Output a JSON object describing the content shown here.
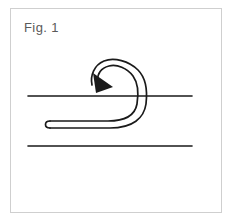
{
  "figure": {
    "caption": "Fig. 1",
    "caption_color": "#5a5a5a",
    "frame_color": "#cfcfcf",
    "background_color": "#ffffff",
    "ink_color": "#1a1a1a",
    "frame": {
      "x": 10,
      "y": 8,
      "width": 212,
      "height": 205
    },
    "caption_position": {
      "x": 24,
      "y": 20
    },
    "elements": {
      "upper_strand": {
        "name": "upper-horizontal-line",
        "x1": 28,
        "y1": 96,
        "x2": 192,
        "y2": 96,
        "stroke_width": 1.6
      },
      "lower_strand": {
        "name": "lower-horizontal-line",
        "x1": 28,
        "y1": 146,
        "x2": 192,
        "y2": 146,
        "stroke_width": 1.6
      },
      "rope_loop": {
        "name": "rope-loop-double-stroke",
        "outer_path": "M 48 121 L 108 121 C 126 121 136 116 138 104 C 140 92 139 83 134 76 C 128 68 118 64 110 66 C 102 68 98 74 99 80 C 100 86 105 89 110 87",
        "inner_path": "M 48 127 L 110 127 C 132 127 143 118 145 104 C 147 88 144 78 137 71 C 128 62 114 58 105 62 C 95 66 91 76 93 84",
        "tip_cap": "M 48 121 C 43 121 43 127 48 127",
        "stroke_width": 1.7
      },
      "arrowhead": {
        "name": "direction-arrowhead",
        "points": "97 92 94 74 112 86",
        "fill": "#1a1a1a",
        "direction": "down-left"
      }
    }
  }
}
